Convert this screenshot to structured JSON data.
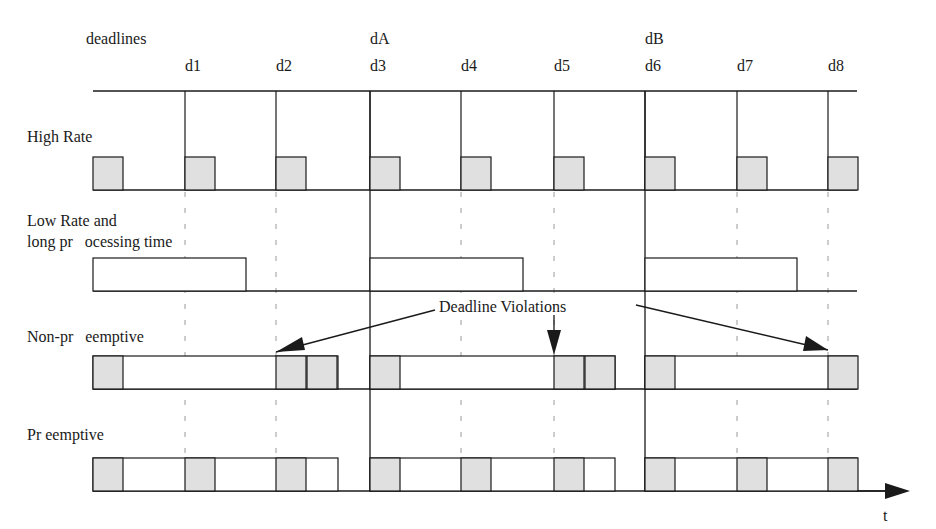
{
  "labels": {
    "deadlines": "deadlines",
    "high_rate": "High Rate",
    "low_rate_line1": "Low Rate and",
    "low_rate_line2": "long pr   ocessing time",
    "non_preemptive": "Non-pr   eemptive",
    "preemptive": "Pr eemptive",
    "violations": "Deadline Violations",
    "time_axis": "t"
  },
  "deadline_marks": [
    {
      "id": "d1",
      "label": "d1",
      "x": 185
    },
    {
      "id": "d2",
      "label": "d2",
      "x": 276
    },
    {
      "id": "d3",
      "label": "d3",
      "x": 370
    },
    {
      "id": "d4",
      "label": "d4",
      "x": 461
    },
    {
      "id": "d5",
      "label": "d5",
      "x": 554
    },
    {
      "id": "d6",
      "label": "d6",
      "x": 645
    },
    {
      "id": "d7",
      "label": "d7",
      "x": 737
    },
    {
      "id": "d8",
      "label": "d8",
      "x": 828
    }
  ],
  "low_rate_deadlines": [
    {
      "id": "dA",
      "label": "dA",
      "x": 370
    },
    {
      "id": "dB",
      "label": "dB",
      "x": 645
    }
  ],
  "colors": {
    "line": "#1a1a1a",
    "task_fill": "#e0e0e0",
    "dash": "#9a9a9a"
  },
  "rows": {
    "high_rate": {
      "y_top": 157,
      "y_base": 190,
      "boxes": [
        93,
        185,
        276,
        370,
        461,
        554,
        645,
        737,
        828
      ]
    },
    "low_rate": {
      "y_top": 258,
      "y_base": 291,
      "segments": [
        [
          93,
          246
        ],
        [
          370,
          523
        ],
        [
          645,
          797
        ]
      ]
    },
    "non_preemptive": {
      "y_top": 356,
      "y_base": 389,
      "outline_segments": [
        [
          93,
          338
        ],
        [
          370,
          615
        ],
        [
          645,
          857
        ]
      ],
      "shaded": [
        93,
        276,
        307,
        370,
        554,
        585,
        645,
        828
      ]
    },
    "preemptive": {
      "y_top": 458,
      "y_base": 491,
      "outline_segments": [
        [
          93,
          338
        ],
        [
          370,
          615
        ],
        [
          645,
          857
        ]
      ],
      "shaded": [
        93,
        185,
        276,
        370,
        461,
        554,
        645,
        737,
        828
      ]
    }
  }
}
